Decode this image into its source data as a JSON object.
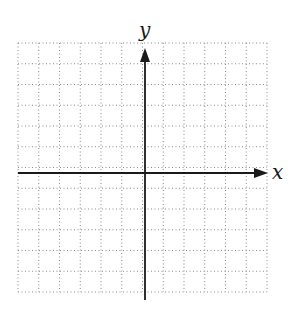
{
  "diagram": {
    "type": "coordinate-plane",
    "grid": {
      "columns": 12,
      "rows": 12,
      "left": 18,
      "top": 43,
      "cell": 20.75,
      "line_style": "dotted",
      "color": "#8a8a8a"
    },
    "axes": {
      "color": "#1a1a1a",
      "x_axis": {
        "label": "x",
        "y": 173,
        "from": 18,
        "to": 268
      },
      "y_axis": {
        "label": "y",
        "x": 145,
        "from": 300,
        "to": 48
      }
    }
  }
}
